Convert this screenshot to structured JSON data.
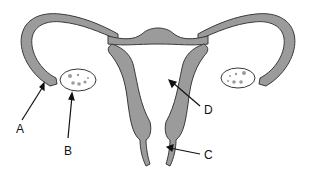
{
  "diagram": {
    "colors": {
      "tissue_fill": "#9b9b9b",
      "outline": "#3a3a3a",
      "background": "#ffffff",
      "text": "#111111"
    },
    "labels": [
      {
        "id": "A",
        "text": "A",
        "points_to": "fimbriae end of left fallopian tube"
      },
      {
        "id": "B",
        "text": "B",
        "points_to": "left ovary"
      },
      {
        "id": "C",
        "text": "C",
        "points_to": "vagina"
      },
      {
        "id": "D",
        "text": "D",
        "points_to": "uterus"
      }
    ]
  }
}
